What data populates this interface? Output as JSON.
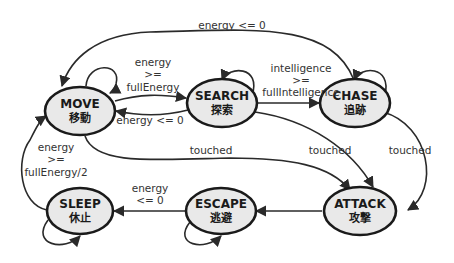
{
  "diagram": {
    "type": "state-machine",
    "nodes": {
      "move": {
        "label": "MOVE",
        "sub": "移動"
      },
      "search": {
        "label": "SEARCH",
        "sub": "探索"
      },
      "chase": {
        "label": "CHASE",
        "sub": "追跡"
      },
      "sleep": {
        "label": "SLEEP",
        "sub": "休止"
      },
      "escape": {
        "label": "ESCAPE",
        "sub": "逃避"
      },
      "attack": {
        "label": "ATTACK",
        "sub": "攻撃"
      }
    },
    "edges": {
      "chase_to_move": {
        "label": "energy <= 0"
      },
      "move_to_search": {
        "line1": "energy",
        "line2": ">=",
        "line3": "fullEnergy"
      },
      "search_to_move": {
        "label": "energy <= 0"
      },
      "search_to_chase": {
        "line1": "intelligence",
        "line2": ">=",
        "line3": "fullIntelligence"
      },
      "sleep_to_move": {
        "line1": "energy",
        "line2": ">=",
        "line3": "fullEnergy/2"
      },
      "move_to_attack": {
        "label": "touched"
      },
      "search_to_attack": {
        "label": "touched"
      },
      "chase_to_attack": {
        "label": "touched"
      },
      "escape_to_sleep": {
        "line1": "energy",
        "line2": "<= 0"
      },
      "attack_to_escape": {
        "label": ""
      }
    },
    "colors": {
      "node_fill": "#e9e9e9",
      "node_stroke": "#1a1a1a",
      "edge": "#2a2a2a",
      "text": "#333333"
    }
  }
}
